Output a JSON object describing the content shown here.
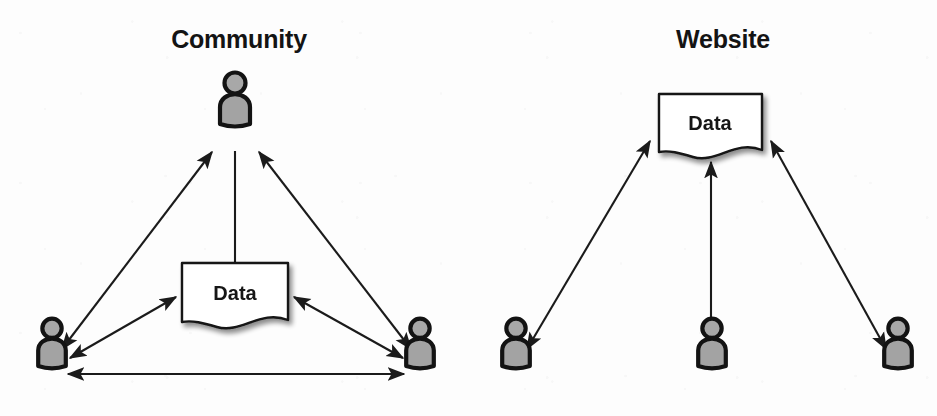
{
  "figure": {
    "kind": "concept-diagram",
    "background_color": "#fdfdfd",
    "ink_color": "#1b1b1b",
    "person_fill_color": "#a3a3a3",
    "document_fill_color": "#ffffff"
  },
  "panels": [
    {
      "id": "community",
      "title": "Community",
      "title_x": 239,
      "title_y": 48,
      "document": {
        "label": "Data",
        "x": 182,
        "y": 263,
        "width": 106,
        "height": 62,
        "label_x": 235,
        "label_y": 300
      },
      "actors": [
        {
          "id": "community-person-top",
          "name": "person-top",
          "x": 235,
          "y": 124,
          "scale": 1.0
        },
        {
          "id": "community-person-bottom-left",
          "name": "person-bottom-left",
          "x": 52,
          "y": 366,
          "scale": 0.92
        },
        {
          "id": "community-person-bottom-right",
          "name": "person-bottom-right",
          "x": 420,
          "y": 366,
          "scale": 0.92
        }
      ],
      "connections": [
        {
          "id": "c-doc-to-top",
          "from": "document",
          "to": "person-top",
          "arrows": "none",
          "x1": 235,
          "y1": 263,
          "x2": 235,
          "y2": 151
        },
        {
          "id": "c-left-to-top",
          "from": "person-bottom-left",
          "to": "person-top",
          "arrows": "both",
          "x1": 62,
          "y1": 349,
          "x2": 212,
          "y2": 152
        },
        {
          "id": "c-right-to-top",
          "from": "person-bottom-right",
          "to": "person-top",
          "arrows": "both",
          "x1": 411,
          "y1": 349,
          "x2": 259,
          "y2": 152
        },
        {
          "id": "c-left-to-doc",
          "from": "person-bottom-left",
          "to": "document",
          "arrows": "both",
          "x1": 70,
          "y1": 358,
          "x2": 176,
          "y2": 297
        },
        {
          "id": "c-right-to-doc",
          "from": "person-bottom-right",
          "to": "document",
          "arrows": "both",
          "x1": 403,
          "y1": 358,
          "x2": 294,
          "y2": 297
        },
        {
          "id": "c-left-to-right",
          "from": "person-bottom-left",
          "to": "person-bottom-right",
          "arrows": "both",
          "x1": 68,
          "y1": 374,
          "x2": 404,
          "y2": 374
        }
      ]
    },
    {
      "id": "website",
      "title": "Website",
      "title_x": 723,
      "title_y": 48,
      "document": {
        "label": "Data",
        "x": 659,
        "y": 94,
        "width": 103,
        "height": 61,
        "label_x": 710,
        "label_y": 130
      },
      "actors": [
        {
          "id": "website-person-left",
          "name": "person-left",
          "x": 516,
          "y": 366,
          "scale": 0.92
        },
        {
          "id": "website-person-center",
          "name": "person-center",
          "x": 712,
          "y": 366,
          "scale": 0.92
        },
        {
          "id": "website-person-right",
          "name": "person-right",
          "x": 898,
          "y": 366,
          "scale": 0.92
        }
      ],
      "connections": [
        {
          "id": "w-left-to-doc",
          "from": "person-left",
          "to": "document",
          "arrows": "both",
          "x1": 527,
          "y1": 349,
          "x2": 650,
          "y2": 141
        },
        {
          "id": "w-center-to-doc",
          "from": "person-center",
          "to": "document",
          "arrows": "both",
          "x1": 711,
          "y1": 349,
          "x2": 711,
          "y2": 162
        },
        {
          "id": "w-right-to-doc",
          "from": "person-right",
          "to": "document",
          "arrows": "both",
          "x1": 886,
          "y1": 349,
          "x2": 771,
          "y2": 141
        }
      ]
    }
  ]
}
